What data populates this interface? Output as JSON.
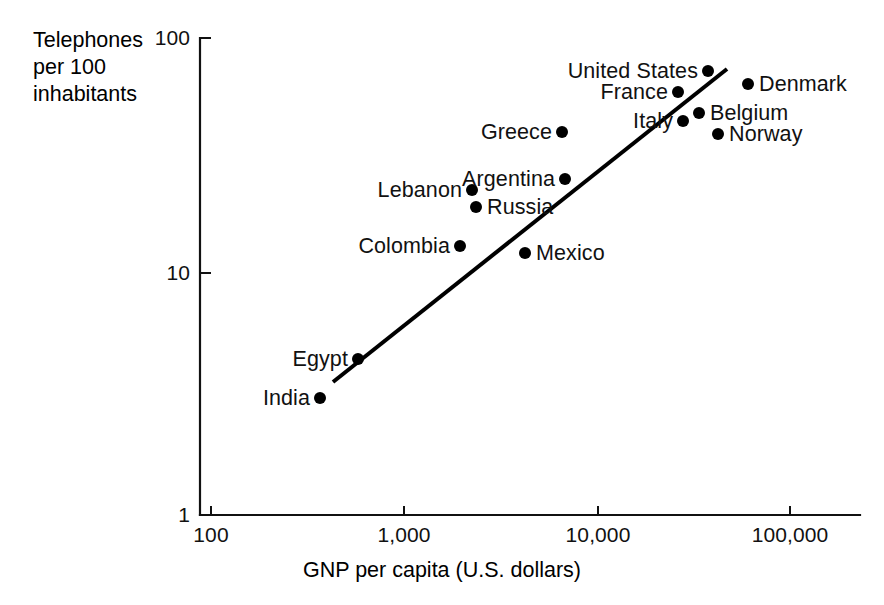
{
  "chart_data": {
    "type": "scatter",
    "title": "",
    "xlabel": "GNP per capita (U.S. dollars)",
    "ylabel": "Telephones per 100 inhabitants",
    "ylabel_lines": [
      "Telephones",
      "per 100",
      "inhabitants"
    ],
    "xscale": "log",
    "yscale": "log",
    "xlim": [
      100,
      100000
    ],
    "ylim": [
      1,
      100
    ],
    "grid": false,
    "legend": "none",
    "xticks": [
      {
        "value": 100,
        "label": "100",
        "px": 211
      },
      {
        "value": 1000,
        "label": "1,000",
        "px": 404
      },
      {
        "value": 10000,
        "label": "10,000",
        "px": 598
      },
      {
        "value": 100000,
        "label": "100,000",
        "px": 790
      }
    ],
    "yticks": [
      {
        "value": 100,
        "label": "100",
        "px": 38
      },
      {
        "value": 10,
        "label": "10",
        "px": 273
      },
      {
        "value": 1,
        "label": "1",
        "px": 515
      }
    ],
    "points": [
      {
        "name": "India",
        "x": 350,
        "y": 3.2,
        "px": 320,
        "py": 398,
        "label_side": "left"
      },
      {
        "name": "Egypt",
        "x": 600,
        "y": 4.5,
        "px": 358,
        "py": 359,
        "label_side": "left"
      },
      {
        "name": "Colombia",
        "x": 2100,
        "y": 13,
        "px": 460,
        "py": 246,
        "label_side": "left"
      },
      {
        "name": "Lebanon",
        "x": 2200,
        "y": 19.5,
        "px": 472,
        "py": 190,
        "label_side": "left"
      },
      {
        "name": "Russia",
        "x": 2300,
        "y": 17.5,
        "px": 476,
        "py": 207,
        "label_side": "right"
      },
      {
        "name": "Mexico",
        "x": 4200,
        "y": 12,
        "px": 525,
        "py": 253,
        "label_side": "right"
      },
      {
        "name": "Argentina",
        "x": 6200,
        "y": 24,
        "px": 565,
        "py": 179,
        "label_side": "left"
      },
      {
        "name": "Greece",
        "x": 6000,
        "y": 38,
        "px": 562,
        "py": 132,
        "label_side": "left"
      },
      {
        "name": "Italy",
        "x": 28000,
        "y": 41,
        "px": 683,
        "py": 121,
        "label_side": "left"
      },
      {
        "name": "France",
        "x": 26000,
        "y": 55,
        "px": 678,
        "py": 92,
        "label_side": "left"
      },
      {
        "name": "Belgium",
        "x": 33000,
        "y": 45,
        "px": 699,
        "py": 113,
        "label_side": "right"
      },
      {
        "name": "Norway",
        "x": 41000,
        "y": 38,
        "px": 718,
        "py": 134,
        "label_side": "right"
      },
      {
        "name": "United States",
        "x": 45000,
        "y": 68,
        "px": 708,
        "py": 71,
        "label_side": "left"
      },
      {
        "name": "Denmark",
        "x": 70000,
        "y": 60,
        "px": 748,
        "py": 84,
        "label_side": "right"
      }
    ],
    "trend_line": {
      "x_start": 1050,
      "y_start": 5.2,
      "x_end": 50000,
      "y_end": 70,
      "px_start": 333,
      "py_start": 382,
      "px_end": 727,
      "py_end": 69
    },
    "colors": {
      "ink": "#000000",
      "background": "#ffffff"
    }
  }
}
